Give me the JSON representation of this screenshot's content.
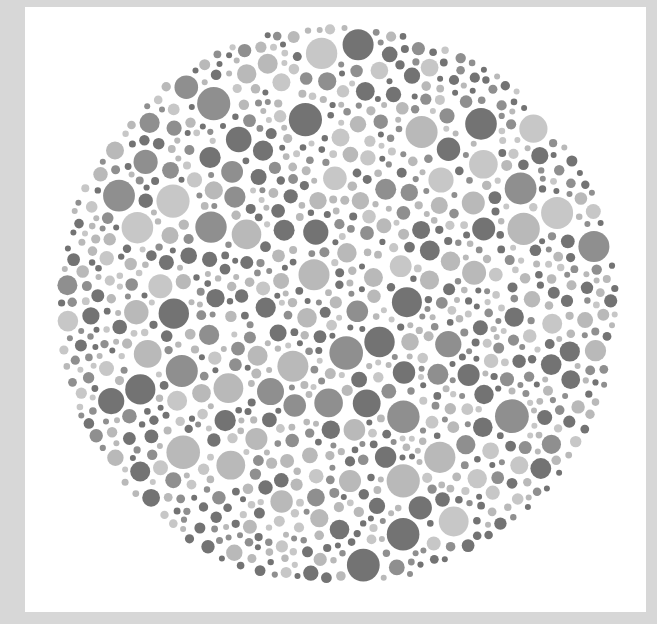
{
  "image": {
    "description": "Grayscale color-vision test plate (Ishihara-style): a circular field of densely packed dots in dark, medium and light gray on a white card with a light gray border",
    "frame_color": "#d7d7d7",
    "panel_color": "#ffffff"
  },
  "plate": {
    "center_x": 337,
    "center_y": 305,
    "radius": 282,
    "dot_radius_min": 3,
    "dot_radius_max": 17,
    "dot_gap": 2.2,
    "attempts": 26000,
    "seed": 20240611,
    "palette": [
      {
        "name": "dark-gray",
        "color": "#737373",
        "weight": 0.3
      },
      {
        "name": "medium-gray",
        "color": "#8f8f8f",
        "weight": 0.22
      },
      {
        "name": "light-gray",
        "color": "#b9b9b9",
        "weight": 0.3
      },
      {
        "name": "pale-gray",
        "color": "#c7c7c7",
        "weight": 0.18
      }
    ]
  }
}
